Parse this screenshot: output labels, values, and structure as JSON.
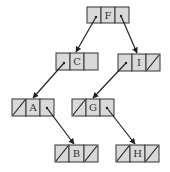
{
  "diagram": {
    "type": "binary-tree-linked-nodes",
    "node_style": {
      "cell_fill": "#d9d9d9",
      "border": "#333333",
      "edge_color": "#222222"
    },
    "nodes": [
      {
        "id": "F",
        "label": "F",
        "x": 87,
        "y": 7,
        "left": "C",
        "right": "I"
      },
      {
        "id": "C",
        "label": "C",
        "x": 56,
        "y": 53,
        "left": "A",
        "right": "empty"
      },
      {
        "id": "I",
        "label": "I",
        "x": 118,
        "y": 54,
        "left": "G",
        "right": null
      },
      {
        "id": "A",
        "label": "A",
        "x": 12,
        "y": 99,
        "left": null,
        "right": "B"
      },
      {
        "id": "G",
        "label": "G",
        "x": 72,
        "y": 99,
        "left": null,
        "right": "H"
      },
      {
        "id": "B",
        "label": "B",
        "x": 55,
        "y": 145,
        "left": null,
        "right": null
      },
      {
        "id": "H",
        "label": "H",
        "x": 116,
        "y": 145,
        "left": null,
        "right": null
      }
    ],
    "edges": [
      {
        "from": "F",
        "side": "left",
        "to": "C"
      },
      {
        "from": "F",
        "side": "right",
        "to": "I"
      },
      {
        "from": "C",
        "side": "left",
        "to": "A"
      },
      {
        "from": "I",
        "side": "left",
        "to": "G"
      },
      {
        "from": "A",
        "side": "right",
        "to": "B"
      },
      {
        "from": "G",
        "side": "right",
        "to": "H"
      }
    ]
  }
}
